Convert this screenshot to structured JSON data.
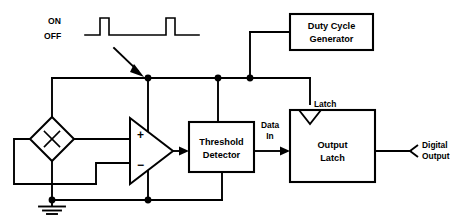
{
  "figure": {
    "kind": "block-diagram",
    "title_visible": false,
    "background_color": "#ffffff",
    "line_color": "#000000"
  },
  "waveform": {
    "label_on": "ON",
    "label_off": "OFF",
    "pulse_count": 2,
    "description": "two narrow positive pulses on a low baseline"
  },
  "blocks": {
    "duty_cycle_generator": {
      "line1": "Duty Cycle",
      "line2": "Generator"
    },
    "threshold_detector": {
      "line1": "Threshold",
      "line2": "Detector"
    },
    "output_latch": {
      "line1": "Output",
      "line2": "Latch"
    }
  },
  "labels": {
    "latch_clock": "Latch",
    "data_in_line1": "Data",
    "data_in_line2": "In",
    "digital_output_line1": "Digital",
    "digital_output_line2": "Output",
    "amp_plus": "+",
    "amp_minus": "−"
  },
  "symbols": {
    "hall_element": "hall-plate-diamond-x",
    "amplifier": "differential-amplifier-triangle",
    "ground": "ground-symbol",
    "supply_arrow": "supply-pointer-arrow"
  }
}
